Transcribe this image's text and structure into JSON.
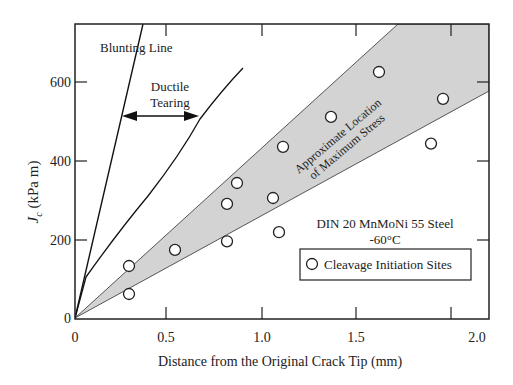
{
  "chart_data": {
    "type": "scatter",
    "title": "",
    "xlabel": "Distance from the Original Crack Tip (mm)",
    "ylabel_main": "J",
    "ylabel_sub": "c",
    "ylabel_units": " (kPa m)",
    "xlim": [
      0,
      2.07
    ],
    "ylim": [
      0,
      747
    ],
    "xticks": [
      0,
      0.5,
      1.0,
      1.5,
      2.0
    ],
    "xtick_labels": [
      "0",
      "0.5",
      "1.0",
      "1.5",
      "2.0"
    ],
    "yticks": [
      0,
      200,
      400,
      600
    ],
    "ytick_labels": [
      "0",
      "200",
      "400",
      "600"
    ],
    "grid": false,
    "series": [
      {
        "name": "Cleavage Initiation Sites",
        "marker": "open-circle",
        "points": [
          {
            "x": 0.27,
            "y": 132
          },
          {
            "x": 0.27,
            "y": 61
          },
          {
            "x": 0.5,
            "y": 173
          },
          {
            "x": 0.76,
            "y": 195
          },
          {
            "x": 0.76,
            "y": 290
          },
          {
            "x": 0.81,
            "y": 343
          },
          {
            "x": 0.99,
            "y": 305
          },
          {
            "x": 1.02,
            "y": 218
          },
          {
            "x": 1.04,
            "y": 435
          },
          {
            "x": 1.28,
            "y": 511
          },
          {
            "x": 1.52,
            "y": 625
          },
          {
            "x": 1.78,
            "y": 443
          },
          {
            "x": 1.84,
            "y": 557
          }
        ]
      }
    ],
    "lines": [
      {
        "name": "Blunting Line",
        "points": [
          {
            "x": 0,
            "y": 0
          },
          {
            "x": 0.36,
            "y": 747
          }
        ]
      },
      {
        "name": "Ductile Tearing curve",
        "points": [
          {
            "x": 0.05,
            "y": 105
          },
          {
            "x": 0.14,
            "y": 185
          },
          {
            "x": 0.25,
            "y": 280
          },
          {
            "x": 0.37,
            "y": 380
          },
          {
            "x": 0.52,
            "y": 470
          },
          {
            "x": 0.66,
            "y": 545
          },
          {
            "x": 0.9,
            "y": 630
          }
        ]
      }
    ],
    "band": {
      "label": "Approximate Location of Maximum Stress",
      "upper_edge": [
        {
          "x": 0,
          "y": 0
        },
        {
          "x": 1.72,
          "y": 747
        }
      ],
      "lower_edge": [
        {
          "x": 0,
          "y": 0
        },
        {
          "x": 2.07,
          "y": 577
        }
      ],
      "color": "#d3d3d3"
    },
    "annotations": [
      {
        "text": "Blunting Line"
      },
      {
        "text": "Ductile Tearing",
        "arrow": "double-headed between blunting line and ductile curve at J≈500"
      },
      {
        "text": "Approximate Location"
      },
      {
        "text": "of Maximum Stress"
      },
      {
        "text": "DIN 20 MnMoNi 55 Steel"
      },
      {
        "text": "-60°C"
      }
    ],
    "legend": {
      "position": "lower-right",
      "entries": [
        "Cleavage Initiation Sites"
      ]
    }
  },
  "labels": {
    "blunting": "Blunting Line",
    "ductile_1": "Ductile",
    "ductile_2": "Tearing",
    "band_1": "Approximate Location",
    "band_2": "of Maximum Stress",
    "material": "DIN 20 MnMoNi 55 Steel",
    "temperature": "-60°C",
    "legend_entry": "Cleavage Initiation Sites"
  }
}
